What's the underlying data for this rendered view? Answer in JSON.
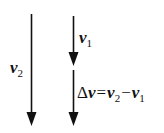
{
  "diagram": {
    "title": "",
    "colors": {
      "stroke": "#111111",
      "background": "#ffffff"
    },
    "vectors": [
      {
        "id": "v2",
        "label_symbol": "v",
        "label_subscript": "2",
        "x": 31.5,
        "y_start": 14,
        "y_end": 126,
        "direction": "down"
      },
      {
        "id": "v1",
        "label_symbol": "v",
        "label_subscript": "1",
        "x": 73.5,
        "y_start": 16,
        "y_end": 66,
        "direction": "down"
      },
      {
        "id": "delta_v",
        "label_symbol": "Δv",
        "x": 73.5,
        "y_start": 70,
        "y_end": 126,
        "direction": "down"
      }
    ],
    "labels": {
      "v2": {
        "symbol": "v",
        "subscript": "2"
      },
      "v1": {
        "symbol": "v",
        "subscript": "1"
      },
      "equation": {
        "delta": "Δ",
        "lhs_symbol": "v",
        "equals": "=",
        "term1_symbol": "v",
        "term1_subscript": "2",
        "minus": "−",
        "term2_symbol": "v",
        "term2_subscript": "1"
      }
    }
  }
}
